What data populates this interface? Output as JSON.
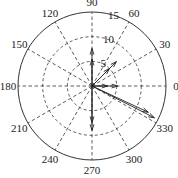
{
  "chart_data": {
    "type": "polar-compass",
    "center": [
      92,
      86
    ],
    "outer_radius_px": 74,
    "radial_ticks": [
      {
        "value": 5,
        "label": "5"
      },
      {
        "value": 10,
        "label": "10"
      },
      {
        "value": 15,
        "label": "15"
      }
    ],
    "rmax": 15,
    "angle_ticks": [
      {
        "deg": 0,
        "label": "0"
      },
      {
        "deg": 30,
        "label": "30"
      },
      {
        "deg": 60,
        "label": "60"
      },
      {
        "deg": 90,
        "label": "90"
      },
      {
        "deg": 120,
        "label": "120"
      },
      {
        "deg": 150,
        "label": "150"
      },
      {
        "deg": 180,
        "label": "180"
      },
      {
        "deg": 210,
        "label": "210"
      },
      {
        "deg": 240,
        "label": "240"
      },
      {
        "deg": 270,
        "label": "270"
      },
      {
        "deg": 300,
        "label": "300"
      },
      {
        "deg": 330,
        "label": "330"
      }
    ],
    "vectors": [
      {
        "angle": 90,
        "magnitude": 7.6
      },
      {
        "angle": 90,
        "magnitude": 5.4
      },
      {
        "angle": 45,
        "magnitude": 7.0
      },
      {
        "angle": 45,
        "magnitude": 5.0
      },
      {
        "angle": 0,
        "magnitude": 5.2
      },
      {
        "angle": 0,
        "magnitude": 3.2
      },
      {
        "angle": 270,
        "magnitude": 7.4
      },
      {
        "angle": 270,
        "magnitude": 9.0
      },
      {
        "angle": 335,
        "magnitude": 12.6
      },
      {
        "angle": 333,
        "magnitude": 14.2
      }
    ],
    "grid": true
  }
}
